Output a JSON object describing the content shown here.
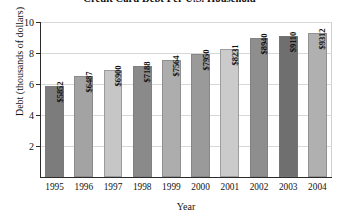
{
  "chart_data": {
    "type": "bar",
    "title": "Credit Card Debt Per U.S. Household",
    "xlabel": "Year",
    "ylabel": "Debt (thousands of dollars)",
    "categories": [
      "1995",
      "1996",
      "1997",
      "1998",
      "1999",
      "2000",
      "2001",
      "2002",
      "2003",
      "2004"
    ],
    "values": [
      5852,
      6487,
      6900,
      7188,
      7564,
      7950,
      8231,
      8940,
      9110,
      9312
    ],
    "value_labels": [
      "$5852",
      "$6487",
      "$6900",
      "$7188",
      "$7564",
      "$7950",
      "$8231",
      "$8940",
      "$9110",
      "$9312"
    ],
    "bar_colors": [
      "#7c7c7c",
      "#a3a3a3",
      "#c6c6c6",
      "#8a8a8a",
      "#adadad",
      "#9a9a9a",
      "#cbcbcb",
      "#8e8e8e",
      "#6f6f6f",
      "#b0b0b0"
    ],
    "ylim": [
      0,
      10
    ],
    "yticks": [
      2,
      4,
      6,
      8,
      10
    ],
    "ytick_labels": [
      "2",
      "4",
      "6",
      "8",
      "10"
    ],
    "y_units": "thousands of dollars",
    "grid": true,
    "legend": null
  }
}
